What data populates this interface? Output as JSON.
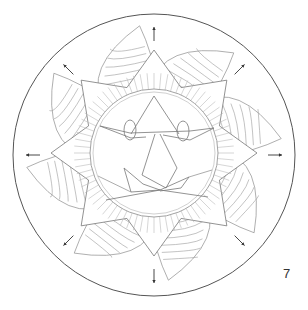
{
  "page": {
    "type": "coloring-page-mandala",
    "page_number": "7"
  },
  "artwork": {
    "outer_circle": "border-circle",
    "star_points": 8,
    "flame_petals": 8,
    "direction_arrows": [
      "up",
      "up-right",
      "right",
      "down-right",
      "down",
      "down-left",
      "left",
      "up-left"
    ],
    "face": {
      "eyes": 2,
      "nose": "triangle",
      "mouth": "crown-shaped"
    }
  },
  "colors": {
    "outline_dark": "#555555",
    "outline_light": "#9a9a9a",
    "background": "#ffffff"
  }
}
